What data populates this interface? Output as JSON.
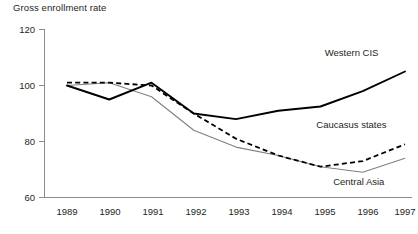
{
  "chart_data": {
    "type": "line",
    "title": "Gross enrollment rate",
    "xlabel": "",
    "ylabel": "",
    "x": [
      1989,
      1990,
      1991,
      1992,
      1993,
      1994,
      1995,
      1996,
      1997
    ],
    "xtick_labels": [
      "1989",
      "1990",
      "1991",
      "1992",
      "1993",
      "1994",
      "1995",
      "1996",
      "1997"
    ],
    "ytick_labels": [
      "60",
      "80",
      "100",
      "120"
    ],
    "yticks": [
      60,
      80,
      100,
      120
    ],
    "ylim": [
      60,
      120
    ],
    "xlim": [
      1989,
      1997
    ],
    "grid": false,
    "legend_position": "inline-annotations",
    "series": [
      {
        "name": "Western CIS",
        "style": "solid-thick-black",
        "color": "#000000",
        "values": [
          100,
          95,
          101,
          90,
          88,
          91,
          92.5,
          98,
          105
        ]
      },
      {
        "name": "Caucasus states",
        "style": "dashed-black",
        "color": "#000000",
        "values": [
          101,
          101,
          100,
          90,
          81,
          75,
          71,
          73,
          79
        ]
      },
      {
        "name": "Central Asia",
        "style": "solid-thin-gray",
        "color": "#808080",
        "values": [
          100,
          101,
          96,
          84,
          78,
          75,
          71,
          69,
          74
        ]
      }
    ],
    "annotations": [
      {
        "text": "Western CIS",
        "x": 1995.1,
        "y": 110.5
      },
      {
        "text": "Caucasus states",
        "x": 1994.9,
        "y": 85.0
      },
      {
        "text": "Central Asia",
        "x": 1995.3,
        "y": 64.5
      }
    ]
  },
  "axis": {
    "y_label_120": "120",
    "y_label_100": "100",
    "y_label_80": "80",
    "y_label_60": "60",
    "x_label_1989": "1989",
    "x_label_1990": "1990",
    "x_label_1991": "1991",
    "x_label_1992": "1992",
    "x_label_1993": "1993",
    "x_label_1994": "1994",
    "x_label_1995": "1995",
    "x_label_1996": "1996",
    "x_label_1997": "1997"
  },
  "labels": {
    "title": "Gross enrollment rate",
    "western_cis": "Western CIS",
    "caucasus_states": "Caucasus states",
    "central_asia": "Central Asia"
  }
}
